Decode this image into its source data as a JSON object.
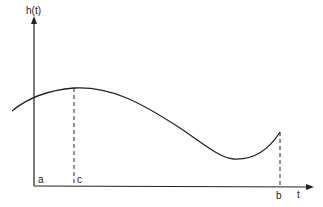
{
  "diagram": {
    "y_axis_label": "h(t)",
    "x_axis_label": "t",
    "points": {
      "a": "a",
      "b": "b",
      "c": "c"
    },
    "curve": {
      "description": "smooth function h(t) rising to a maximum at t=c, falling to a minimum, then rising to the endpoint at t=b",
      "color": "#222222"
    },
    "dashed_lines": [
      "c",
      "b"
    ]
  }
}
